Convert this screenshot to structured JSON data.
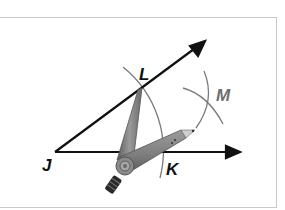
{
  "figure": {
    "points": {
      "J": {
        "label": "J",
        "color": "#111111"
      },
      "L": {
        "label": "L",
        "color": "#111111"
      },
      "K": {
        "label": "K",
        "color": "#111111"
      },
      "M": {
        "label": "M",
        "color": "#6e6e6e"
      }
    },
    "rays": [
      {
        "name": "ray-JL",
        "from": "J",
        "through": "L"
      },
      {
        "name": "ray-JK",
        "from": "J",
        "through": "K"
      }
    ],
    "tool": "compass",
    "colors": {
      "line": "#111111",
      "arc": "#7a7a7a",
      "compass_body": "#8c8c8c",
      "compass_dark": "#4a4a4a",
      "frame_border": "#c8c8c8"
    }
  }
}
